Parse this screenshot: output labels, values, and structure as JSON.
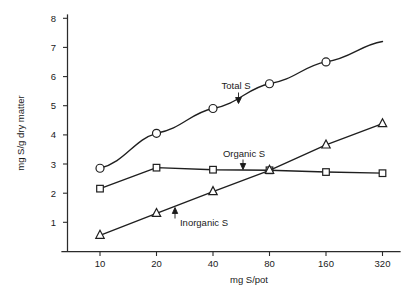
{
  "chart_data": {
    "type": "line",
    "title": "",
    "xlabel": "mg S/pot",
    "ylabel": "mg S/g dry matter",
    "x": [
      10,
      20,
      40,
      80,
      160,
      320
    ],
    "xticklabels": [
      "10",
      "20",
      "40",
      "80",
      "160",
      "320"
    ],
    "xscale": "log2",
    "yticklabels": [
      "1",
      "2",
      "3",
      "4",
      "5",
      "6",
      "7",
      "8"
    ],
    "yticks": [
      1,
      2,
      3,
      4,
      5,
      6,
      7,
      8
    ],
    "ylim": [
      0,
      8.35
    ],
    "grid": false,
    "legend": "inline-annotations",
    "series": [
      {
        "name": "Total S",
        "marker": "circle",
        "values": [
          2.85,
          4.05,
          4.9,
          5.75,
          6.5,
          7.2
        ],
        "last_point_marked": false
      },
      {
        "name": "Organic S",
        "marker": "square",
        "values": [
          2.15,
          2.87,
          2.8,
          2.78,
          2.72,
          2.68
        ],
        "last_point_marked": true
      },
      {
        "name": "Inorganic S",
        "marker": "triangle",
        "values": [
          0.55,
          1.3,
          2.05,
          2.78,
          3.65,
          4.38
        ],
        "last_point_marked": true
      }
    ],
    "annotations": [
      {
        "text": "Total S",
        "series": "Total S"
      },
      {
        "text": "Organic S",
        "series": "Organic S"
      },
      {
        "text": "Inorganic S",
        "series": "Inorganic S"
      }
    ]
  },
  "axes": {
    "y_title": "mg S/g dry matter",
    "x_title": "mg S/pot",
    "y_ticks": [
      {
        "label": "8"
      },
      {
        "label": "7"
      },
      {
        "label": "6"
      },
      {
        "label": "5"
      },
      {
        "label": "4"
      },
      {
        "label": "3"
      },
      {
        "label": "2"
      },
      {
        "label": "1"
      }
    ],
    "x_ticks": [
      {
        "label": "10"
      },
      {
        "label": "20"
      },
      {
        "label": "40"
      },
      {
        "label": "80"
      },
      {
        "label": "160"
      },
      {
        "label": "320"
      }
    ]
  },
  "labels": {
    "total_s": "Total S",
    "organic_s": "Organic S",
    "inorganic_s": "Inorganic S"
  },
  "colors": {
    "ink": "#1a1a1a",
    "axis": "#2b2b2b",
    "background": "#ffffff",
    "marker_fill": "#ffffff"
  }
}
